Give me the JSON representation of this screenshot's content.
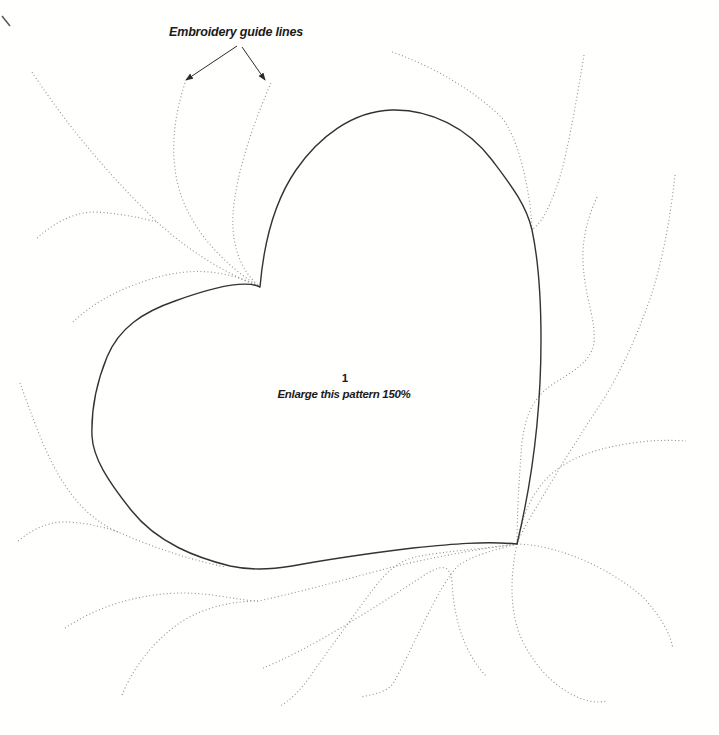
{
  "figure": {
    "annotation_label": "Embroidery guide lines",
    "pattern_number": "1",
    "instruction": "Enlarge this pattern 150%"
  },
  "colors": {
    "background": "#fffffe",
    "heart_stroke": "#333333",
    "guide_dotted": "#8f8f8f",
    "arrow": "#2a2a2a",
    "text": "#1b1b1b"
  },
  "geometry": {
    "canvas": {
      "width": 719,
      "height": 735
    },
    "heart_path": "M 260,287 C 264,240 276,199 296,170 C 318,138 352,111 392,110 C 430,109 468,128 492,160 C 510,184 526,204 532,230 C 539,263 541,300 541,340 C 541,425 529,494 517,544 C 485,541 452,544 413,548 C 372,553 330,559 292,566 C 268,570 248,570 230,566 C 198,558 158,544 131,510 C 108,481 93,458 92,436 C 91,408 96,384 107,357 C 119,328 143,312 175,301 C 208,289 244,279 260,287",
    "scan_mark_path": "M 2,16 L 10,26",
    "arrows": [
      {
        "name": "annotation-arrow-left",
        "path": "M 237,46 L 186,80"
      },
      {
        "name": "annotation-arrow-right",
        "path": "M 242,47 L 265,80"
      }
    ],
    "guide_lines": [
      {
        "name": "guide-top-left-diagonal",
        "path": "M 32,72 C 70,130 112,178 157,222 C 192,254 228,274 260,287"
      },
      {
        "name": "guide-left-mid-arc",
        "path": "M 37,238 C 56,221 76,212 95,212 C 116,213 138,217 157,222"
      },
      {
        "name": "guide-notch-inner-left",
        "path": "M 185,83 C 172,122 170,160 180,192 C 191,228 222,264 260,287"
      },
      {
        "name": "guide-notch-inner-right",
        "path": "M 271,83 C 254,122 236,172 233,214 C 231,250 244,274 260,287"
      },
      {
        "name": "guide-lower-left-to-notch",
        "path": "M 73,322 C 97,299 128,285 162,276 C 198,267 232,272 260,287"
      },
      {
        "name": "guide-left-descender",
        "path": "M 20,383 C 30,410 42,446 58,474 C 76,505 94,521 118,532 C 152,547 190,560 226,567"
      },
      {
        "name": "guide-left-small-arc",
        "path": "M 18,541 C 35,527 52,521 68,522 C 85,523 101,526 118,532"
      },
      {
        "name": "guide-right-upper-inner",
        "path": "M 392,52 C 438,68 478,94 502,118 C 518,138 526,178 530,205 C 531,215 532,223 532,230"
      },
      {
        "name": "guide-right-upper-outer",
        "path": "M 584,55 C 578,92 572,126 566,153 C 560,181 552,201 544,216 C 540,223 536,226 532,230"
      },
      {
        "name": "guide-right-s-curve",
        "path": "M 597,197 C 587,219 582,240 583,262 C 585,300 596,318 594,343 C 591,362 572,372 553,384 C 534,397 526,412 522,442 C 519,478 517,515 517,544"
      },
      {
        "name": "guide-right-long-arc",
        "path": "M 675,175 C 671,212 664,256 651,296 C 638,333 623,368 603,400 C 583,431 564,460 549,486 C 536,508 523,528 517,544"
      },
      {
        "name": "guide-point-northeast",
        "path": "M 517,544 C 523,513 531,496 546,479 C 570,455 602,447 640,442 C 656,440 671,440 686,441"
      },
      {
        "name": "guide-bottom-long-wave",
        "path": "M 65,628 C 95,608 135,594 180,593 C 215,593 235,600 258,601 C 310,590 360,575 405,564 C 445,555 485,548 517,544"
      },
      {
        "name": "guide-bottom-left-riser",
        "path": "M 122,695 C 135,664 155,640 181,622 C 206,606 236,601 258,601"
      },
      {
        "name": "guide-bottom-hook",
        "path": "M 263,668 C 308,650 368,612 420,578 C 441,564 450,563 452,582 C 454,618 463,652 487,677"
      },
      {
        "name": "guide-point-sweep-outer",
        "path": "M 517,544 C 482,549 445,551 415,557 C 396,562 384,574 368,596 C 348,624 327,652 309,678 C 299,692 289,701 280,706"
      },
      {
        "name": "guide-point-sweep-inner",
        "path": "M 517,544 C 495,550 470,556 458,566 C 448,576 437,596 425,620 C 412,646 402,668 394,682 C 388,692 375,694 361,697"
      },
      {
        "name": "guide-point-right-loop",
        "path": "M 517,544 C 558,545 608,567 643,597 C 662,618 670,634 673,648"
      },
      {
        "name": "guide-point-under-loop",
        "path": "M 517,544 C 511,572 509,604 519,633 C 531,663 554,687 577,697 C 588,702 599,703 607,701"
      }
    ]
  }
}
